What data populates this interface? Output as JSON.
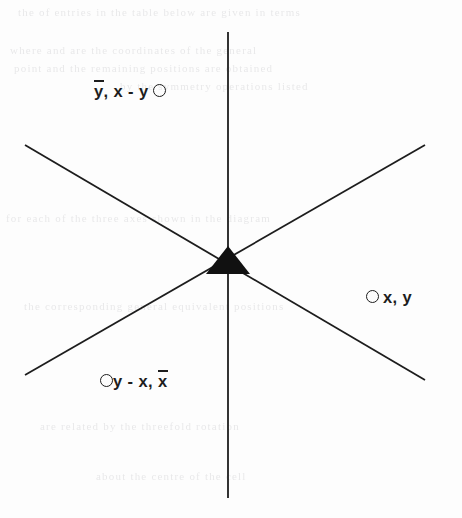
{
  "figure": {
    "background_color": "#fdfdfd",
    "ink_color": "#1d1d1d",
    "width": 462,
    "height": 518
  },
  "diagram": {
    "type": "three-axis-star-junction",
    "center": {
      "x": 228,
      "y": 272
    },
    "marker": {
      "name": "filled-triangle",
      "shape": "triangle-up",
      "fill": "#111111",
      "apex": {
        "x": 228,
        "y": 246
      },
      "base_left": {
        "x": 206,
        "y": 274
      },
      "base_right": {
        "x": 250,
        "y": 274
      }
    },
    "lines": [
      {
        "name": "vertical-axis",
        "x1": 228,
        "y1": 32,
        "x2": 228,
        "y2": 498
      },
      {
        "name": "diagonal-nwse-axis",
        "x1": 25,
        "y1": 145,
        "x2": 425,
        "y2": 380
      },
      {
        "name": "diagonal-swne-axis",
        "x1": 25,
        "y1": 375,
        "x2": 425,
        "y2": 145
      }
    ],
    "line_width": 1.8
  },
  "labels": {
    "top_left": {
      "name": "label-y-bar-x-minus-y",
      "plain_text": "ȳ, x - yO",
      "parts": [
        {
          "kind": "overline-var",
          "text": "y"
        },
        {
          "kind": "text",
          "text": ", x - y"
        },
        {
          "kind": "circle-marker",
          "text": "O"
        }
      ]
    },
    "right": {
      "name": "label-x-y",
      "plain_text": "O x, y",
      "parts": [
        {
          "kind": "circle-marker",
          "text": "O"
        },
        {
          "kind": "text",
          "text": "x, y"
        }
      ]
    },
    "bottom_left": {
      "name": "label-y-minus-x-x-bar",
      "plain_text": "Oy - x, x̄",
      "parts": [
        {
          "kind": "circle-marker",
          "text": "O"
        },
        {
          "kind": "text",
          "text": "y - x, "
        },
        {
          "kind": "overline-var",
          "text": "x"
        }
      ]
    }
  },
  "ghost_text": {
    "description": "faint show-through of text printed on the reverse side of the scanned page",
    "rows": [
      {
        "text": "the  of  entries  in  the  table  below  are  given  in  terms",
        "x": 18,
        "y": 6
      },
      {
        "text": "where  and  are  the  coordinates  of  the  general",
        "x": 10,
        "y": 44
      },
      {
        "text": "point  and  the  remaining  positions  are  obtained",
        "x": 14,
        "y": 62
      },
      {
        "text": "by  the  symmetry  operations  listed",
        "x": 120,
        "y": 80
      },
      {
        "text": "for  each  of  the  three  axes  shown  in  the  diagram",
        "x": 6,
        "y": 212
      },
      {
        "text": "the  corresponding  general  equivalent  positions",
        "x": 24,
        "y": 300
      },
      {
        "text": "are  related  by  the  threefold  rotation",
        "x": 40,
        "y": 420
      },
      {
        "text": "about  the  centre  of  the  cell",
        "x": 96,
        "y": 470
      }
    ]
  }
}
